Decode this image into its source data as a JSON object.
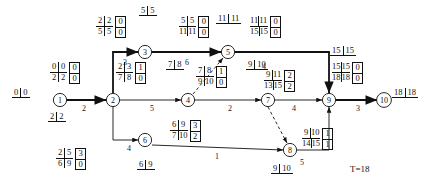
{
  "diagram": {
    "total_time_label": "T=18",
    "nodes": [
      {
        "id": "1",
        "label": "1",
        "x": 60,
        "y": 100
      },
      {
        "id": "2",
        "label": "2",
        "x": 113,
        "y": 100
      },
      {
        "id": "3",
        "label": "3",
        "x": 145,
        "y": 52
      },
      {
        "id": "4",
        "label": "4",
        "x": 188,
        "y": 100
      },
      {
        "id": "5",
        "label": "5",
        "x": 228,
        "y": 52
      },
      {
        "id": "6",
        "label": "6",
        "x": 145,
        "y": 140
      },
      {
        "id": "7",
        "label": "7",
        "x": 268,
        "y": 100
      },
      {
        "id": "8",
        "label": "8",
        "x": 290,
        "y": 150
      },
      {
        "id": "9",
        "label": "9",
        "x": 329,
        "y": 100
      },
      {
        "id": "10",
        "label": "10",
        "x": 384,
        "y": 100
      }
    ],
    "edge_durations": [
      {
        "name": "edge-1-2",
        "value": "2",
        "x": 82,
        "y": 104
      },
      {
        "name": "edge-2-3",
        "value": "3",
        "x": 123,
        "y": 58
      },
      {
        "name": "edge-3-5",
        "value": "6",
        "x": 185,
        "y": 58
      },
      {
        "name": "edge-2-4",
        "value": "5",
        "x": 150,
        "y": 104
      },
      {
        "name": "edge-4-7",
        "value": "2",
        "x": 228,
        "y": 104
      },
      {
        "name": "edge-5-7",
        "value": "4",
        "x": 262,
        "y": 62
      },
      {
        "name": "edge-7-9",
        "value": "4",
        "x": 292,
        "y": 104
      },
      {
        "name": "edge-9-10",
        "value": "3",
        "x": 356,
        "y": 104
      },
      {
        "name": "edge-2-6",
        "value": "4",
        "x": 127,
        "y": 144
      },
      {
        "name": "edge-6-8",
        "value": "1",
        "x": 215,
        "y": 152
      },
      {
        "name": "edge-8-9",
        "value": "5",
        "x": 300,
        "y": 158
      }
    ],
    "pair_labels": [
      {
        "name": "pair-node-1",
        "a": "0",
        "b": "0",
        "x": 12,
        "y": 88
      },
      {
        "name": "pair-node-2",
        "a": "2",
        "b": "2",
        "x": 48,
        "y": 112
      },
      {
        "name": "pair-node-3",
        "a": "5",
        "b": "5",
        "x": 139,
        "y": 6
      },
      {
        "name": "pair-node-4",
        "a": "7",
        "b": "8",
        "x": 166,
        "y": 60
      },
      {
        "name": "pair-node-5",
        "a": "11",
        "b": "11",
        "x": 216,
        "y": 14
      },
      {
        "name": "pair-node-6",
        "a": "6",
        "b": "9",
        "x": 137,
        "y": 160
      },
      {
        "name": "pair-node-7",
        "a": "9",
        "b": "10",
        "x": 246,
        "y": 60
      },
      {
        "name": "pair-node-8",
        "a": "9",
        "b": "10",
        "x": 271,
        "y": 164
      },
      {
        "name": "pair-node-9",
        "a": "15",
        "b": "15",
        "x": 330,
        "y": 46
      },
      {
        "name": "pair-node-10",
        "a": "18",
        "b": "18",
        "x": 392,
        "y": 88
      }
    ],
    "matrix_labels": [
      {
        "name": "matrix-act-1-2",
        "es": "0",
        "ef": "0",
        "ls": "2",
        "lf": "2",
        "tf": "0",
        "ff": "0",
        "x": 50,
        "y": 62
      },
      {
        "name": "matrix-act-2-3",
        "es": "2",
        "ef": "2",
        "ls": "5",
        "lf": "5",
        "tf": "0",
        "ff": "0",
        "x": 96,
        "y": 16
      },
      {
        "name": "matrix-act-3-5",
        "es": "5",
        "ef": "5",
        "ls": "11",
        "lf": "11",
        "tf": "0",
        "ff": "0",
        "x": 179,
        "y": 16
      },
      {
        "name": "matrix-act-5-7",
        "es": "11",
        "ef": "11",
        "ls": "15",
        "lf": "15",
        "tf": "0",
        "ff": "0",
        "x": 250,
        "y": 16
      },
      {
        "name": "matrix-act-9-10",
        "es": "15",
        "ef": "15",
        "ls": "18",
        "lf": "18",
        "tf": "0",
        "ff": "0",
        "x": 332,
        "y": 62
      },
      {
        "name": "matrix-act-2-4",
        "es": "2",
        "ef": "3",
        "ls": "7",
        "lf": "8",
        "tf": "1",
        "ff": "0",
        "x": 116,
        "y": 62
      },
      {
        "name": "matrix-act-4-7",
        "es": "7",
        "ef": "8",
        "ls": "9",
        "lf": "10",
        "tf": "1",
        "ff": "0",
        "x": 196,
        "y": 66
      },
      {
        "name": "matrix-act-7-9",
        "es": "9",
        "ef": "11",
        "ls": "13",
        "lf": "15",
        "tf": "2",
        "ff": "2",
        "x": 264,
        "y": 70
      },
      {
        "name": "matrix-act-2-6",
        "es": "2",
        "ef": "5",
        "ls": "6",
        "lf": "9",
        "tf": "3",
        "ff": "0",
        "x": 56,
        "y": 148
      },
      {
        "name": "matrix-act-6-8",
        "es": "6",
        "ef": "9",
        "ls": "7",
        "lf": "10",
        "tf": "3",
        "ff": "2",
        "x": 170,
        "y": 120
      },
      {
        "name": "matrix-act-8-9",
        "es": "9",
        "ef": "10",
        "ls": "14",
        "lf": "15",
        "tf": "1",
        "ff": "1",
        "x": 302,
        "y": 128
      }
    ],
    "total_time": {
      "x": 350,
      "y": 164
    }
  }
}
